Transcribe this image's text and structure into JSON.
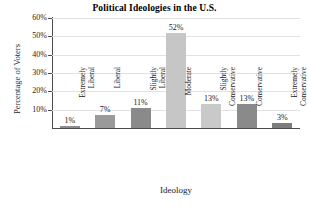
{
  "chart_data": {
    "type": "bar",
    "title": "Political Ideologies in the U.S.",
    "xlabel": "Ideology",
    "ylabel": "Percentage of Voters",
    "categories": [
      "Extremely Liberal",
      "Liberal",
      "Slightly Liberal",
      "Moderate",
      "Slightly Conservative",
      "Conservative",
      "Extremely Conservative"
    ],
    "category_lines": [
      [
        "Extremely",
        "Liberal"
      ],
      [
        "Liberal",
        ""
      ],
      [
        "Slightly",
        "Liberal"
      ],
      [
        "Moderate",
        ""
      ],
      [
        "Slightly",
        "Conservative"
      ],
      [
        "Conservative",
        ""
      ],
      [
        "Extremely",
        "Conservative"
      ]
    ],
    "values": [
      1,
      7,
      11,
      52,
      13,
      13,
      3
    ],
    "value_labels": [
      "1%",
      "7%",
      "11%",
      "52%",
      "13%",
      "13%",
      "3%"
    ],
    "bar_colors": [
      "#8c8c8c",
      "#9a9a9a",
      "#8a8a8a",
      "#c6c6c6",
      "#c9c9c9",
      "#8a8a8a",
      "#7d7d7d"
    ],
    "ytick_labels": [
      "10%",
      "20%",
      "30%",
      "40%",
      "50%",
      "60%"
    ],
    "ytick_values": [
      10,
      20,
      30,
      40,
      50,
      60
    ],
    "ylim": [
      0,
      60
    ],
    "grid": true,
    "legend": "none",
    "axis_color": "#4a4a4a",
    "grid_color": "#e2e2e2",
    "text_color": "#1a1a1a"
  }
}
